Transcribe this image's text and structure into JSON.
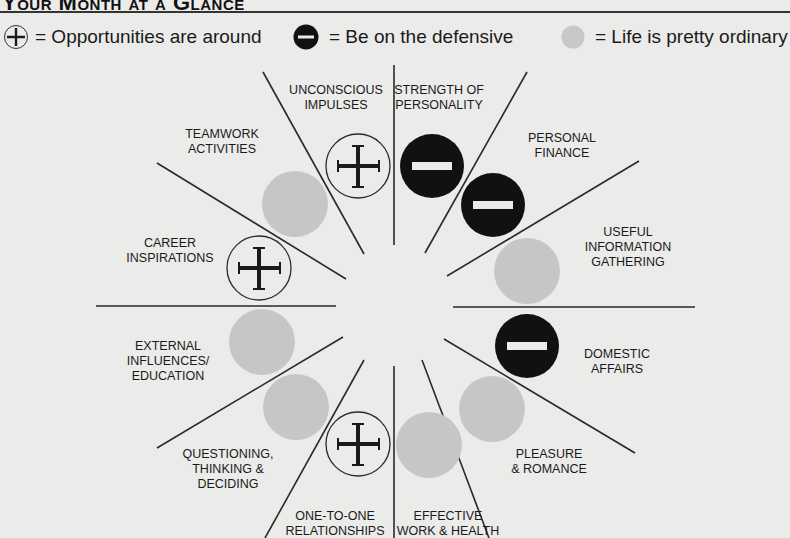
{
  "header": {
    "title": "Your Month at a Glance"
  },
  "legend": {
    "items": [
      {
        "icon": "plus-circle-icon",
        "label": "= Opportunities are around"
      },
      {
        "icon": "minus-circle-icon",
        "label": "= Be on the defensive"
      },
      {
        "icon": "grey-circle-icon",
        "label": "= Life is pretty ordinary"
      }
    ]
  },
  "wheel": {
    "colors": {
      "plus": "#1a1a1a",
      "minus": "#111111",
      "ordinary": "#c4c4c4",
      "line": "#2a2a2a"
    },
    "sectors": [
      {
        "label": "Strength of\nPersonality",
        "status": "minus"
      },
      {
        "label": "Personal\nFinance",
        "status": "minus"
      },
      {
        "label": "Useful\nInformation\nGathering",
        "status": "ordinary"
      },
      {
        "label": "Domestic\nAffairs",
        "status": "minus"
      },
      {
        "label": "Pleasure\n& Romance",
        "status": "ordinary"
      },
      {
        "label": "Effective\nWork & Health",
        "status": "ordinary"
      },
      {
        "label": "One-to-One\nRelationships",
        "status": "plus"
      },
      {
        "label": "Questioning,\nThinking &\nDeciding",
        "status": "ordinary"
      },
      {
        "label": "External\nInfluences/\nEducation",
        "status": "ordinary"
      },
      {
        "label": "Career\nInspirations",
        "status": "plus"
      },
      {
        "label": "Teamwork\nActivities",
        "status": "ordinary"
      },
      {
        "label": "Unconscious\nImpulses",
        "status": "plus"
      }
    ]
  }
}
